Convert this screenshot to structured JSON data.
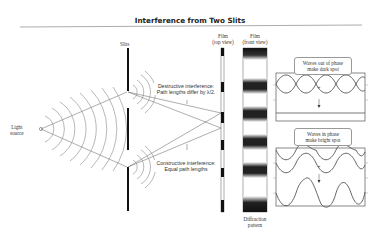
{
  "title": "Interference from Two Slits",
  "labels": {
    "light_source_line1": "Light",
    "light_source_line2": "source",
    "slits": "Slits",
    "film_top_line1": "Film",
    "film_top_line2": "(top view)",
    "film_front_line1": "Film",
    "film_front_line2": "(front view)",
    "destructive_line1": "Destructive interference:",
    "destructive_line2": "Path lengths differ by λ/2.",
    "constructive_line1": "Constructive interference:",
    "constructive_line2": "Equal path lengths",
    "diffraction_line1": "Diffraction",
    "diffraction_line2": "pattern"
  },
  "callouts": {
    "out_of_phase_line1": "Waves out of phase",
    "out_of_phase_line2": "make dark spot",
    "in_phase_line1": "Waves in phase",
    "in_phase_line2": "make bright spot"
  },
  "symbols": {
    "plus": "+",
    "arrow_down": "↓"
  },
  "colors": {
    "line": "#555555",
    "wave": "#555555",
    "slit": "#111111",
    "divider": "#888888"
  }
}
